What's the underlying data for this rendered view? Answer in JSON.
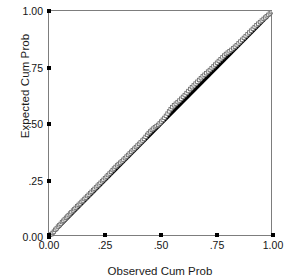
{
  "chart_data": {
    "type": "scatter",
    "title": "",
    "subtitle": "",
    "xlabel": "Observed Cum Prob",
    "ylabel": "Expected Cum Prob",
    "xlim": [
      0.0,
      1.0
    ],
    "ylim": [
      0.0,
      1.0
    ],
    "grid": false,
    "legend": "none",
    "xticks": [
      0.0,
      0.25,
      0.5,
      0.75,
      1.0
    ],
    "yticks": [
      0.0,
      0.25,
      0.5,
      0.75,
      1.0
    ],
    "xticklabels": [
      "0.00",
      ".25",
      ".50",
      ".75",
      "1.00"
    ],
    "yticklabels": [
      "0.00",
      ".25",
      ".50",
      ".75",
      "1.00"
    ],
    "series": [
      {
        "name": "Reference line",
        "type": "line",
        "color": "#000000",
        "x": [
          0.0,
          1.0
        ],
        "y": [
          0.0,
          1.0
        ]
      },
      {
        "name": "Data points",
        "type": "scatter",
        "marker": "open-square",
        "color": "#6e6e6e",
        "points": [
          [
            0.004,
            0.006
          ],
          [
            0.01,
            0.012
          ],
          [
            0.016,
            0.018
          ],
          [
            0.022,
            0.024
          ],
          [
            0.028,
            0.032
          ],
          [
            0.034,
            0.038
          ],
          [
            0.04,
            0.046
          ],
          [
            0.046,
            0.052
          ],
          [
            0.052,
            0.058
          ],
          [
            0.058,
            0.066
          ],
          [
            0.064,
            0.072
          ],
          [
            0.07,
            0.078
          ],
          [
            0.076,
            0.085
          ],
          [
            0.082,
            0.091
          ],
          [
            0.088,
            0.097
          ],
          [
            0.094,
            0.104
          ],
          [
            0.1,
            0.11
          ],
          [
            0.107,
            0.117
          ],
          [
            0.113,
            0.123
          ],
          [
            0.119,
            0.129
          ],
          [
            0.126,
            0.136
          ],
          [
            0.132,
            0.142
          ],
          [
            0.138,
            0.148
          ],
          [
            0.145,
            0.155
          ],
          [
            0.151,
            0.161
          ],
          [
            0.158,
            0.168
          ],
          [
            0.164,
            0.174
          ],
          [
            0.171,
            0.181
          ],
          [
            0.177,
            0.187
          ],
          [
            0.184,
            0.194
          ],
          [
            0.19,
            0.2
          ],
          [
            0.197,
            0.207
          ],
          [
            0.203,
            0.213
          ],
          [
            0.21,
            0.22
          ],
          [
            0.217,
            0.227
          ],
          [
            0.223,
            0.233
          ],
          [
            0.23,
            0.24
          ],
          [
            0.237,
            0.247
          ],
          [
            0.243,
            0.253
          ],
          [
            0.25,
            0.26
          ],
          [
            0.257,
            0.267
          ],
          [
            0.263,
            0.274
          ],
          [
            0.27,
            0.281
          ],
          [
            0.277,
            0.288
          ],
          [
            0.284,
            0.296
          ],
          [
            0.29,
            0.303
          ],
          [
            0.297,
            0.31
          ],
          [
            0.304,
            0.317
          ],
          [
            0.311,
            0.323
          ],
          [
            0.318,
            0.329
          ],
          [
            0.325,
            0.335
          ],
          [
            0.332,
            0.342
          ],
          [
            0.339,
            0.349
          ],
          [
            0.346,
            0.356
          ],
          [
            0.353,
            0.363
          ],
          [
            0.36,
            0.37
          ],
          [
            0.367,
            0.377
          ],
          [
            0.374,
            0.384
          ],
          [
            0.381,
            0.391
          ],
          [
            0.388,
            0.398
          ],
          [
            0.395,
            0.405
          ],
          [
            0.402,
            0.412
          ],
          [
            0.409,
            0.419
          ],
          [
            0.417,
            0.427
          ],
          [
            0.424,
            0.434
          ],
          [
            0.431,
            0.443
          ],
          [
            0.438,
            0.452
          ],
          [
            0.445,
            0.46
          ],
          [
            0.452,
            0.467
          ],
          [
            0.459,
            0.474
          ],
          [
            0.466,
            0.48
          ],
          [
            0.473,
            0.486
          ],
          [
            0.48,
            0.491
          ],
          [
            0.487,
            0.496
          ],
          [
            0.494,
            0.503
          ],
          [
            0.501,
            0.511
          ],
          [
            0.508,
            0.519
          ],
          [
            0.515,
            0.527
          ],
          [
            0.522,
            0.536
          ],
          [
            0.529,
            0.546
          ],
          [
            0.536,
            0.556
          ],
          [
            0.543,
            0.566
          ],
          [
            0.55,
            0.575
          ],
          [
            0.558,
            0.583
          ],
          [
            0.566,
            0.59
          ],
          [
            0.574,
            0.597
          ],
          [
            0.582,
            0.604
          ],
          [
            0.59,
            0.612
          ],
          [
            0.598,
            0.62
          ],
          [
            0.606,
            0.628
          ],
          [
            0.614,
            0.637
          ],
          [
            0.622,
            0.646
          ],
          [
            0.63,
            0.655
          ],
          [
            0.638,
            0.663
          ],
          [
            0.646,
            0.671
          ],
          [
            0.654,
            0.679
          ],
          [
            0.662,
            0.687
          ],
          [
            0.67,
            0.695
          ],
          [
            0.678,
            0.703
          ],
          [
            0.686,
            0.711
          ],
          [
            0.694,
            0.718
          ],
          [
            0.702,
            0.725
          ],
          [
            0.71,
            0.732
          ],
          [
            0.718,
            0.739
          ],
          [
            0.726,
            0.747
          ],
          [
            0.734,
            0.755
          ],
          [
            0.742,
            0.763
          ],
          [
            0.75,
            0.771
          ],
          [
            0.758,
            0.779
          ],
          [
            0.766,
            0.787
          ],
          [
            0.774,
            0.795
          ],
          [
            0.782,
            0.803
          ],
          [
            0.79,
            0.81
          ],
          [
            0.798,
            0.816
          ],
          [
            0.806,
            0.822
          ],
          [
            0.814,
            0.828
          ],
          [
            0.822,
            0.835
          ],
          [
            0.83,
            0.842
          ],
          [
            0.838,
            0.849
          ],
          [
            0.846,
            0.857
          ],
          [
            0.854,
            0.865
          ],
          [
            0.862,
            0.873
          ],
          [
            0.87,
            0.881
          ],
          [
            0.878,
            0.889
          ],
          [
            0.886,
            0.897
          ],
          [
            0.894,
            0.905
          ],
          [
            0.902,
            0.913
          ],
          [
            0.91,
            0.921
          ],
          [
            0.918,
            0.929
          ],
          [
            0.926,
            0.937
          ],
          [
            0.934,
            0.944
          ],
          [
            0.942,
            0.951
          ],
          [
            0.95,
            0.958
          ],
          [
            0.958,
            0.965
          ],
          [
            0.965,
            0.971
          ],
          [
            0.972,
            0.977
          ],
          [
            0.979,
            0.983
          ],
          [
            0.986,
            0.989
          ],
          [
            0.993,
            0.995
          ],
          [
            0.999,
            0.999
          ]
        ]
      }
    ]
  }
}
